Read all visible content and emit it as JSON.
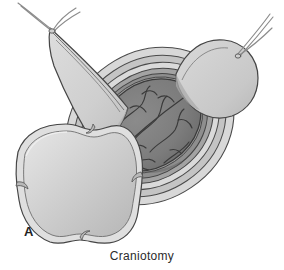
{
  "figure": {
    "panel_label": "A",
    "caption": "Craniotomy",
    "background_color": "#ffffff"
  },
  "palette": {
    "outline": "#3c3c3c",
    "outline_soft": "#6f6f6f",
    "scalp_flap": "#d2d2d2",
    "scalp_flap_shadow": "#bdbdbd",
    "scalp_flap_edge": "#e8e8e8",
    "bone_flap_fill": "#c9c9c9",
    "bone_flap_highlight": "#efefef",
    "bone_flap_rim": "#dcdcdc",
    "skull_ring_light": "#d8d8d8",
    "skull_ring_mid": "#a8a8a8",
    "dura_ring": "#8f8f8f",
    "dura_ring_dark": "#7a7a7a",
    "brain_fill": "#7f7f7f",
    "brain_shadow": "#6a6a6a",
    "sulci_line": "#3a3a3a",
    "suture_thread": "#8a8a8a",
    "text_color": "#2b2b2b"
  },
  "anatomy": {
    "parts": [
      {
        "id": "scalp-flap-left",
        "label": "Reflected scalp flap (left)"
      },
      {
        "id": "scalp-flap-right",
        "label": "Reflected scalp flap (right)"
      },
      {
        "id": "suture-left",
        "label": "Retraction suture (left)"
      },
      {
        "id": "suture-right",
        "label": "Retraction suture (right)"
      },
      {
        "id": "skull-margin",
        "label": "Cut skull margin"
      },
      {
        "id": "dura-layer",
        "label": "Reflected dura mater"
      },
      {
        "id": "brain-surface",
        "label": "Exposed cerebral cortex"
      },
      {
        "id": "bone-flap",
        "label": "Removed bone flap"
      }
    ]
  }
}
